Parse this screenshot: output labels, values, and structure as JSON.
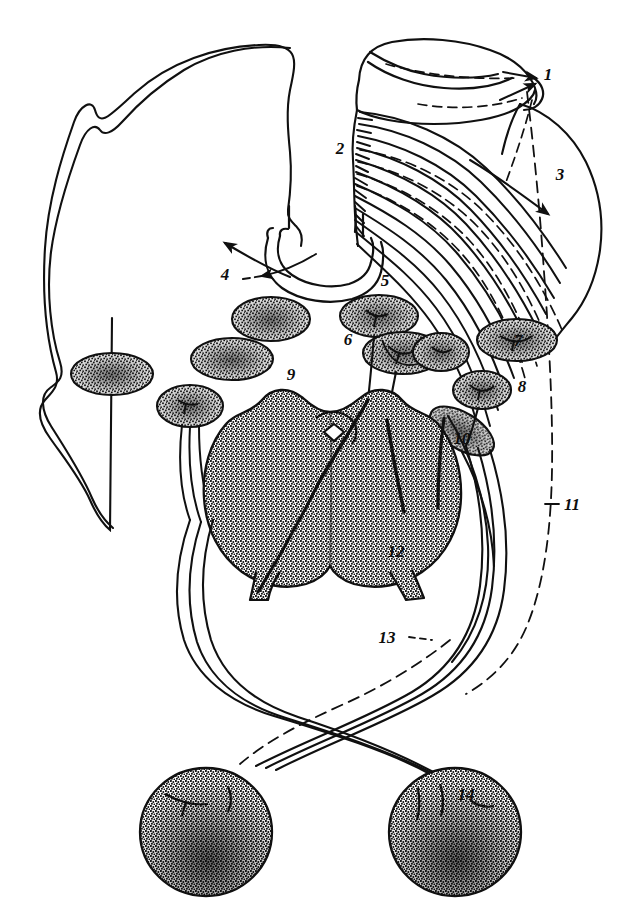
{
  "figure": {
    "kind": "anatomical-line-drawing",
    "style": "black ink line art with stippled shading on white background",
    "width": 634,
    "height": 920,
    "background_color": "#ffffff",
    "ink_color": "#101010"
  },
  "labels": [
    {
      "id": "1",
      "text": "1",
      "x": 548,
      "y": 80,
      "leader": "dashed-arrows",
      "points_to": "upper-right tubular organ (cut end)"
    },
    {
      "id": "2",
      "text": "2",
      "x": 340,
      "y": 154,
      "leader": "none",
      "points_to": "origin of parallel lymphatic vessel bundle"
    },
    {
      "id": "3",
      "text": "3",
      "x": 560,
      "y": 180,
      "leader": "arrow",
      "points_to": "right organ lobe"
    },
    {
      "id": "4",
      "text": "4",
      "x": 225,
      "y": 280,
      "leader": "dashed-arrow",
      "points_to": "U-shaped tube (trachea / esophagus)"
    },
    {
      "id": "5",
      "text": "5",
      "x": 385,
      "y": 286,
      "leader": "solid-vessel",
      "points_to": "lymph node below tube"
    },
    {
      "id": "6",
      "text": "6",
      "x": 348,
      "y": 345,
      "leader": "solid-vessel",
      "points_to": "paired lymph node"
    },
    {
      "id": "7",
      "text": "7",
      "x": 518,
      "y": 340,
      "leader": "none",
      "points_to": "right lateral lymph node"
    },
    {
      "id": "8",
      "text": "8",
      "x": 522,
      "y": 392,
      "leader": "none",
      "points_to": "small right lymph node"
    },
    {
      "id": "9",
      "text": "9",
      "x": 291,
      "y": 380,
      "leader": "none",
      "points_to": "large central lobed organ (upper border)"
    },
    {
      "id": "10",
      "text": "10",
      "x": 462,
      "y": 444,
      "leader": "none",
      "points_to": "elongate node at organ margin"
    },
    {
      "id": "11",
      "text": "11",
      "x": 568,
      "y": 504,
      "leader": "dashed",
      "points_to": "long dashed lymphatic trunk on the right"
    },
    {
      "id": "12",
      "text": "12",
      "x": 396,
      "y": 553,
      "leader": "none",
      "points_to": "central lobed organ (lower border)"
    },
    {
      "id": "13",
      "text": "13",
      "x": 387,
      "y": 637,
      "leader": "dashed",
      "points_to": "crossing lymphatic vessel"
    },
    {
      "id": "14",
      "text": "14",
      "x": 466,
      "y": 795,
      "leader": "none",
      "points_to": "lower right spherical node"
    }
  ],
  "structures": {
    "left_organ": {
      "name": "left-organ-outline",
      "filled": false,
      "description": "large unshaded lobe occupying the upper-left"
    },
    "right_organ": {
      "name": "right-organ-outline",
      "filled": false,
      "description": "rounded lobe on the upper-right behind the vessel bundle"
    },
    "top_tube": {
      "name": "upper-tubular-organ",
      "description": "cut tubular organ at top right with dashed outline and arrowheads"
    },
    "u_tube": {
      "name": "u-shaped-tube",
      "description": "double-walled U-shaped tube, bifurcation of trachea / esophagus"
    },
    "vessel_bundle": {
      "name": "lymphatic-vessel-bundle",
      "count": 14,
      "description": "fan of parallel curved collecting vessels sweeping right and down"
    },
    "central_organ": {
      "name": "central-lobed-organ",
      "label_ids": [
        "9",
        "12"
      ],
      "shading": "dense stipple",
      "description": "bilobed stippled organ with two descending stalks and a small diamond hilus"
    },
    "bottom_nodes": {
      "name": "spherical-lymph-nodes",
      "count": 2,
      "label_ids": [
        "14"
      ],
      "description": "two large stippled spherical nodes at bottom, fed by crossing vessels"
    },
    "oval_nodes": {
      "name": "oval-lymph-nodes",
      "count": 9,
      "description": "stippled oval lymph nodes scattered through the middle field"
    }
  }
}
